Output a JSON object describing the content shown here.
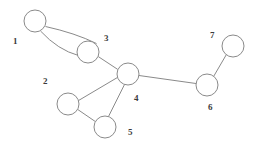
{
  "figure": {
    "kind": "undirected-graph-diagram",
    "width": 255,
    "height": 150,
    "background_color": "#ffffff",
    "stroke_color": "#8a8a8a",
    "label_color": "#3b3b3b",
    "node_radius": 11
  },
  "nodes": [
    {
      "id": "1",
      "label": "1",
      "cx": 35,
      "cy": 21,
      "r": 11,
      "label_x": 13,
      "label_y": 37
    },
    {
      "id": "2",
      "label": "2",
      "cx": 68,
      "cy": 104,
      "r": 11,
      "label_x": 43,
      "label_y": 77
    },
    {
      "id": "3",
      "label": "3",
      "cx": 88,
      "cy": 52,
      "r": 11,
      "label_x": 104,
      "label_y": 34
    },
    {
      "id": "4",
      "label": "4",
      "cx": 128,
      "cy": 74,
      "r": 11,
      "label_x": 134,
      "label_y": 94
    },
    {
      "id": "5",
      "label": "5",
      "cx": 105,
      "cy": 127,
      "r": 11,
      "label_x": 128,
      "label_y": 128
    },
    {
      "id": "6",
      "label": "6",
      "cx": 207,
      "cy": 85,
      "r": 11,
      "label_x": 208,
      "label_y": 103
    },
    {
      "id": "7",
      "label": "7",
      "cx": 233,
      "cy": 46,
      "r": 11,
      "label_x": 210,
      "label_y": 31
    }
  ],
  "edges": [
    {
      "id": "e13a",
      "from": "1",
      "to": "3",
      "style": "curved-upper",
      "path": "M 45.5 26.5 Q 75 33 96.5 43.5"
    },
    {
      "id": "e13b",
      "from": "1",
      "to": "3",
      "style": "curved-lower",
      "path": "M 40.5 31 Q 58 50 78.5 55.5"
    },
    {
      "id": "e34",
      "from": "3",
      "to": "4",
      "style": "straight",
      "path": "M 98.3 56.6 L 117.7 69.4"
    },
    {
      "id": "e24",
      "from": "2",
      "to": "4",
      "style": "straight",
      "path": "M 78.4 100.6 L 117.6 77.4"
    },
    {
      "id": "e25",
      "from": "2",
      "to": "5",
      "style": "straight",
      "path": "M 77.9 109.6 L 95.1 121.4"
    },
    {
      "id": "e45",
      "from": "4",
      "to": "5",
      "style": "straight",
      "path": "M 124.5 84.5 L 108.5 116.5"
    },
    {
      "id": "e46",
      "from": "4",
      "to": "6",
      "style": "straight",
      "path": "M 139.0 75.5 L 196.0 83.5"
    },
    {
      "id": "e67",
      "from": "6",
      "to": "7",
      "style": "straight",
      "path": "M 213.7 76.3 L 226.3 54.7"
    }
  ]
}
